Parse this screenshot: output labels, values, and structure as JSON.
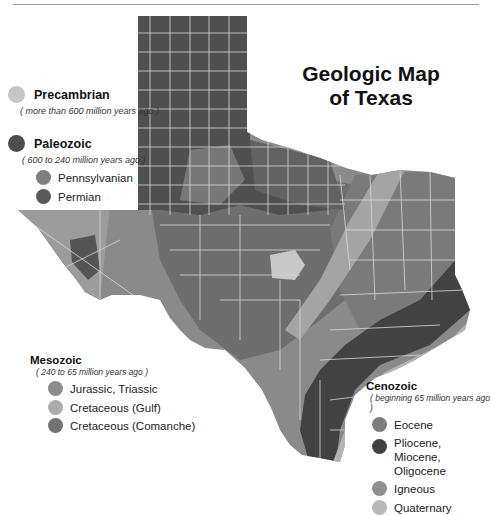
{
  "title": {
    "line1": "Geologic Map",
    "line2": "of Texas"
  },
  "legend": {
    "precambrian": {
      "name": "Precambrian",
      "note": "( more than 600 million years ago )",
      "color": "#c6c6c6"
    },
    "paleozoic": {
      "name": "Paleozoic",
      "note": "( 600 to 240 million years ago )",
      "color": "#4d4d4d",
      "items": [
        {
          "label": "Pennsylvanian",
          "color": "#7f7f7f"
        },
        {
          "label": "Permian",
          "color": "#5a5a5a"
        }
      ]
    },
    "mesozoic": {
      "name": "Mesozoic",
      "note": "( 240 to 65 million years ago )",
      "items": [
        {
          "label": "Jurassic, Triassic",
          "color": "#8c8c8c"
        },
        {
          "label": "Cretaceous (Gulf)",
          "color": "#acacac"
        },
        {
          "label": "Cretaceous (Comanche)",
          "color": "#727272"
        }
      ]
    },
    "cenozoic": {
      "name": "Cenozoic",
      "note": "( beginning 65 million years ago )",
      "items": [
        {
          "label": "Eocene",
          "color": "#7d7d7d"
        },
        {
          "label": "Pliocene, Miocene,",
          "label2": "Oligocene",
          "color": "#404040"
        },
        {
          "label": "Igneous",
          "color": "#8e8e8e"
        },
        {
          "label": "Quaternary",
          "color": "#b8b8b8"
        }
      ]
    }
  },
  "map": {
    "colors": {
      "panhandle": "#505050",
      "permian": "#5c5c5c",
      "comanche": "#6e6e6e",
      "west": "#8a8a8a",
      "eocene": "#7a7a7a",
      "oligocene_band": "#424242",
      "quaternary": "#b5b5b5",
      "gulf": "#a4a4a4",
      "precambrian": "#c8c8c8",
      "county_lines": "#d8d8d8"
    }
  }
}
